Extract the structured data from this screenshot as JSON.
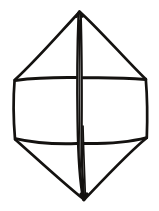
{
  "figure": {
    "subject_name": "hexagonal-bipyramid-crystal",
    "style": "black-ink-line-engraving",
    "background_color": "#ffffff",
    "ink_color": "#141210",
    "canvas": {
      "width": 159,
      "height": 211
    },
    "caption": "",
    "labels": []
  },
  "geometry": {
    "description": "Elongated hexagonal crystal: pointed top and bottom apexes, a central prism band bounded by two horizontal girdle lines, and a prominent vertical front edge drawn as a double line.",
    "vertices": {
      "top_apex": {
        "x": 79,
        "y": 11
      },
      "bottom_apex": {
        "x": 84,
        "y": 200
      },
      "upper_left": {
        "x": 14,
        "y": 80
      },
      "upper_right": {
        "x": 146,
        "y": 79
      },
      "lower_left": {
        "x": 15,
        "y": 139
      },
      "lower_right": {
        "x": 147,
        "y": 137
      }
    },
    "edges": [
      {
        "name": "upper-left-pyramid-edge",
        "from": "top_apex",
        "to": "upper_left"
      },
      {
        "name": "upper-right-pyramid-edge",
        "from": "top_apex",
        "to": "upper_right"
      },
      {
        "name": "left-prism-edge",
        "from": "upper_left",
        "to": "lower_left"
      },
      {
        "name": "right-prism-edge",
        "from": "upper_right",
        "to": "lower_right"
      },
      {
        "name": "lower-left-pyramid-edge",
        "from": "lower_left",
        "to": "bottom_apex"
      },
      {
        "name": "lower-right-pyramid-edge",
        "from": "lower_right",
        "to": "bottom_apex"
      },
      {
        "name": "upper-girdle-line",
        "from": "upper_left",
        "to": "upper_right"
      },
      {
        "name": "lower-girdle-line",
        "from": "lower_left",
        "to": "lower_right"
      },
      {
        "name": "central-vertical-edge",
        "from": "top_apex",
        "to": "bottom_apex"
      }
    ]
  }
}
